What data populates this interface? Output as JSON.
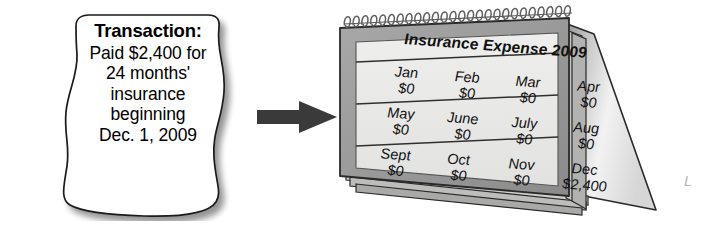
{
  "figure": {
    "type": "accounting-illustration",
    "background_color": "#ffffff"
  },
  "note": {
    "name": "transaction-note",
    "title": "Transaction:",
    "lines": [
      "Paid $2,400 for",
      "24 months'",
      "insurance",
      "beginning",
      "Dec. 1, 2009"
    ],
    "paper_color": "#ffffff",
    "outline_color": "#1a1a1a",
    "shadow_color": "#c9c9c9"
  },
  "arrow": {
    "name": "flow-arrow",
    "direction": "right",
    "color": "#3a3a3a"
  },
  "calendar": {
    "name": "desk-calendar",
    "title": "Insurance Expense 2009",
    "page_color": "#e9e9e7",
    "frame_color": "#9d9d9d",
    "rule_color": "#333333",
    "binding": {
      "name": "spiral-binding",
      "coil_count": 26,
      "color": "#6f6f6f"
    },
    "rows": [
      [
        {
          "month": "Jan",
          "amount": "$0"
        },
        {
          "month": "Feb",
          "amount": "$0"
        },
        {
          "month": "Mar",
          "amount": "$0"
        },
        {
          "month": "Apr",
          "amount": "$0"
        }
      ],
      [
        {
          "month": "May",
          "amount": "$0"
        },
        {
          "month": "June",
          "amount": "$0"
        },
        {
          "month": "July",
          "amount": "$0"
        },
        {
          "month": "Aug",
          "amount": "$0"
        }
      ],
      [
        {
          "month": "Sept",
          "amount": "$0"
        },
        {
          "month": "Oct",
          "amount": "$0"
        },
        {
          "month": "Nov",
          "amount": "$0"
        },
        {
          "month": "Dec",
          "amount": "$2,400"
        }
      ]
    ]
  },
  "margin_mark": {
    "name": "cropped-margin-glyph",
    "text": "L"
  }
}
